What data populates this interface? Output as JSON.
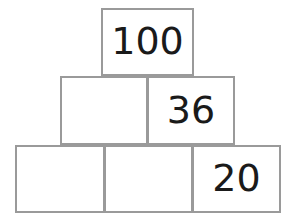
{
  "diagram": {
    "type": "number-pyramid",
    "rows": [
      {
        "index": 1,
        "cells": [
          {
            "value": "100",
            "filled": true
          }
        ]
      },
      {
        "index": 2,
        "cells": [
          {
            "value": "",
            "filled": false
          },
          {
            "value": "36",
            "filled": true
          }
        ]
      },
      {
        "index": 3,
        "cells": [
          {
            "value": "",
            "filled": false
          },
          {
            "value": "",
            "filled": false
          },
          {
            "value": "20",
            "filled": true
          }
        ]
      }
    ]
  },
  "colors": {
    "border": "#9a9a9a",
    "cell_background": "#ffffff",
    "text": "#1a1a1a",
    "page_background": "#ffffff"
  }
}
